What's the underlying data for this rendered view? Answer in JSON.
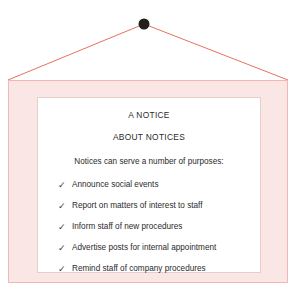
{
  "scene": {
    "name": "hanging notice board",
    "background_color": "#ffffff"
  },
  "hanger": {
    "nail_icon": "nail-dot",
    "nail_color": "#231f1e",
    "cord_color": "#e8705f",
    "nail_x": 144,
    "nail_y": 24,
    "left_anchor_x": 8,
    "right_anchor_x": 288,
    "anchor_y": 80
  },
  "frame": {
    "fill_color": "#fae6e5",
    "border_color": "#f2b8b3"
  },
  "board": {
    "fill_color": "#ffffff",
    "border_color": "#e8cecb"
  },
  "notice": {
    "title_primary": "A NOTICE",
    "title_secondary": "ABOUT NOTICES",
    "lead": "Notices can serve a number of purposes:",
    "check_glyph": "✓",
    "text_color": "#2b2b2b",
    "items": [
      {
        "label": "Announce social events"
      },
      {
        "label": "Report on matters of interest to staff"
      },
      {
        "label": "Inform staff of new procedures"
      },
      {
        "label": "Advertise posts for internal appointment"
      },
      {
        "label": "Remind staff of company procedures"
      }
    ]
  }
}
